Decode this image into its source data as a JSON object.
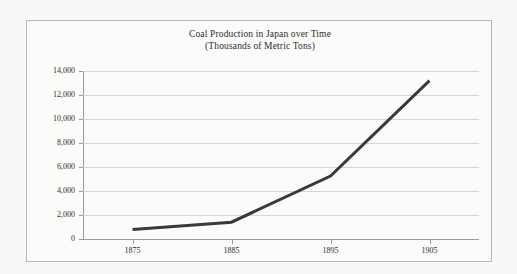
{
  "chart_data": {
    "type": "line",
    "title": "Coal Production in Japan over Time",
    "subtitle": "(Thousands of Metric Tons)",
    "xlabel": "",
    "ylabel": "",
    "categories": [
      "1875",
      "1885",
      "1895",
      "1905"
    ],
    "series": [
      {
        "name": "Coal Production",
        "values": [
          800,
          1400,
          5250,
          13200
        ],
        "color": "#3a3a3a",
        "line_width": 3
      }
    ],
    "ylim": [
      0,
      14000
    ],
    "y_ticks": [
      0,
      2000,
      4000,
      6000,
      8000,
      10000,
      12000,
      14000
    ],
    "y_tick_labels": [
      "0",
      "2,000",
      "4,000",
      "6,000",
      "8,000",
      "10,000",
      "12,000",
      "14,000"
    ],
    "grid": true,
    "grid_axis": "y",
    "legend": false,
    "legend_position": "none",
    "background_color": "#fbfbfa",
    "grid_color": "#d4d4d4",
    "axis_color": "#9a9a9a",
    "border_color": "#b9b9b9",
    "text_color": "#2b2b2b"
  }
}
